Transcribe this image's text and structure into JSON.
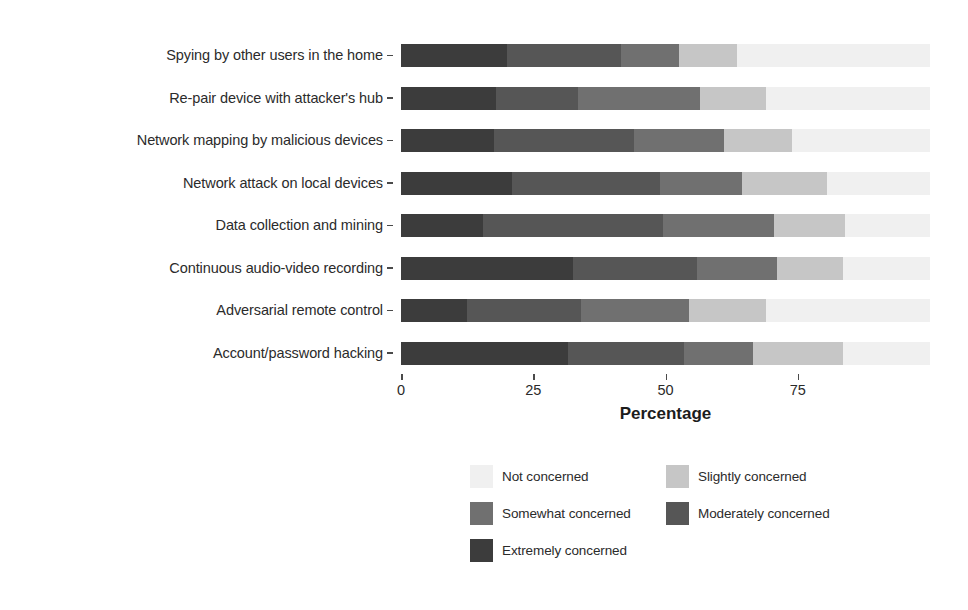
{
  "chart_data": {
    "type": "bar",
    "subtype": "horizontal-stacked-100",
    "title": "",
    "xlabel": "Percentage",
    "ylabel": "Privacy/Security Attacks",
    "xlim": [
      0,
      100
    ],
    "xticks": [
      0,
      25,
      50,
      75
    ],
    "xtick_labels": [
      "0",
      "25",
      "50",
      "75"
    ],
    "grid": false,
    "legend_position": "bottom",
    "categories": [
      "Spying by other users in the home",
      "Re-pair device with attacker's hub",
      "Network mapping by malicious devices",
      "Network attack on local devices",
      "Data collection and mining",
      "Continuous audio-video recording",
      "Adversarial remote control",
      "Account/password hacking"
    ],
    "series": [
      {
        "name": "Extremely concerned",
        "color": "#3c3c3c",
        "values": [
          20.0,
          18.0,
          17.5,
          21.0,
          15.5,
          32.5,
          12.5,
          31.5
        ]
      },
      {
        "name": "Moderately concerned",
        "color": "#565656",
        "values": [
          21.5,
          15.5,
          26.5,
          28.0,
          34.0,
          23.5,
          21.5,
          22.0
        ]
      },
      {
        "name": "Somewhat concerned",
        "color": "#707070",
        "values": [
          11.0,
          23.0,
          17.0,
          15.5,
          21.0,
          15.0,
          20.5,
          13.0
        ]
      },
      {
        "name": "Slightly concerned",
        "color": "#c6c6c6",
        "values": [
          11.0,
          12.5,
          13.0,
          16.0,
          13.5,
          12.5,
          14.5,
          17.0
        ]
      },
      {
        "name": "Not concerned",
        "color": "#f0f0f0",
        "values": [
          36.5,
          31.0,
          26.0,
          19.5,
          16.0,
          16.5,
          31.0,
          16.5
        ]
      }
    ]
  },
  "axes": {
    "y_title": "Privacy/Security Attacks",
    "x_title": "Percentage"
  },
  "legend": {
    "items": [
      {
        "label": "Not concerned",
        "color": "#f0f0f0"
      },
      {
        "label": "Slightly concerned",
        "color": "#c6c6c6"
      },
      {
        "label": "Somewhat concerned",
        "color": "#707070"
      },
      {
        "label": "Moderately concerned",
        "color": "#565656"
      },
      {
        "label": "Extremely concerned",
        "color": "#3c3c3c"
      }
    ]
  }
}
